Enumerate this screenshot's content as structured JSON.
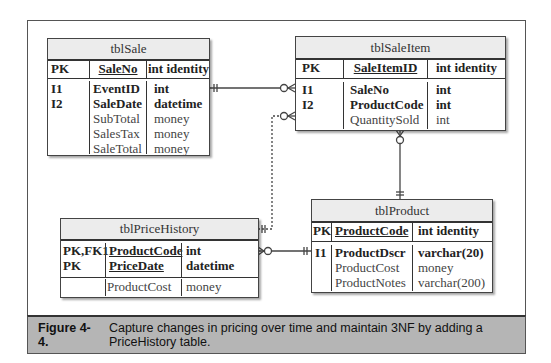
{
  "figure": {
    "label": "Figure 4-4.",
    "caption": "Capture changes in pricing over time and maintain 3NF by adding a PriceHistory table."
  },
  "tables": {
    "sale": {
      "name": "tblSale",
      "pk": {
        "key": "PK",
        "field": "SaleNo",
        "type": "int identity"
      },
      "rows": [
        {
          "key": "I1",
          "field": "EventID",
          "type": "int",
          "bold": true
        },
        {
          "key": "I2",
          "field": "SaleDate",
          "type": "datetime",
          "bold": true
        },
        {
          "key": "",
          "field": "SubTotal",
          "type": "money",
          "bold": false
        },
        {
          "key": "",
          "field": "SalesTax",
          "type": "money",
          "bold": false
        },
        {
          "key": "",
          "field": "SaleTotal",
          "type": "money",
          "bold": false
        }
      ]
    },
    "saleitem": {
      "name": "tblSaleItem",
      "pk": {
        "key": "PK",
        "field": "SaleItemID",
        "type": "int identity"
      },
      "rows": [
        {
          "key": "I1",
          "field": "SaleNo",
          "type": "int",
          "bold": true
        },
        {
          "key": "I2",
          "field": "ProductCode",
          "type": "int",
          "bold": true
        },
        {
          "key": "",
          "field": "QuantitySold",
          "type": "int",
          "bold": false
        }
      ]
    },
    "pricehistory": {
      "name": "tblPriceHistory",
      "pk": [
        {
          "key": "PK,FK1",
          "field": "ProductCode",
          "type": "int"
        },
        {
          "key": "PK",
          "field": "PriceDate",
          "type": "datetime"
        }
      ],
      "rows": [
        {
          "key": "",
          "field": "ProductCost",
          "type": "money",
          "bold": false
        }
      ]
    },
    "product": {
      "name": "tblProduct",
      "pk": {
        "key": "PK",
        "field": "ProductCode",
        "type": "int identity"
      },
      "rows": [
        {
          "key": "I1",
          "field": "ProductDscr",
          "type": "varchar(20)",
          "bold": true
        },
        {
          "key": "",
          "field": "ProductCost",
          "type": "money",
          "bold": false
        },
        {
          "key": "",
          "field": "ProductNotes",
          "type": "varchar(200)",
          "bold": false
        }
      ]
    }
  },
  "relationships": [
    {
      "from": "tblSale",
      "to": "tblSaleItem",
      "from_card": "one",
      "to_card": "zero-or-many",
      "style": "solid"
    },
    {
      "from": "tblPriceHistory",
      "to": "tblSaleItem",
      "from_card": "one",
      "to_card": "zero-or-many",
      "style": "dashed"
    },
    {
      "from": "tblProduct",
      "to": "tblSaleItem",
      "from_card": "one",
      "to_card": "zero-or-many",
      "style": "solid"
    },
    {
      "from": "tblProduct",
      "to": "tblPriceHistory",
      "from_card": "one",
      "to_card": "zero-or-many",
      "style": "solid"
    }
  ]
}
